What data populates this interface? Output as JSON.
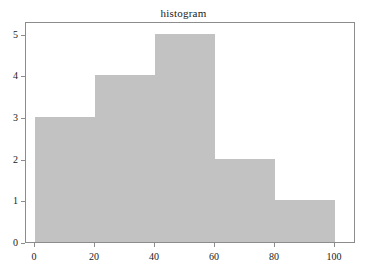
{
  "chart_data": {
    "type": "bar",
    "title": "histogram",
    "xlabel": "",
    "ylabel": "",
    "categories": [
      "0-20",
      "20-40",
      "40-60",
      "60-80",
      "80-100"
    ],
    "bin_edges": [
      0,
      20,
      40,
      60,
      80,
      100
    ],
    "values": [
      3,
      4,
      5,
      2,
      1
    ],
    "xlim": [
      -3,
      107
    ],
    "ylim": [
      0,
      5.3
    ],
    "xticks": [
      0,
      20,
      40,
      60,
      80,
      100
    ],
    "yticks": [
      0,
      1,
      2,
      3,
      4,
      5
    ],
    "xtick_labels": [
      "0",
      "20",
      "40",
      "60",
      "80",
      "100"
    ],
    "ytick_labels": [
      "0",
      "1",
      "2",
      "3",
      "4",
      "5"
    ],
    "grid": false,
    "legend": null,
    "bar_color": "#c2c2c2",
    "frame_color": "#8c8c8c",
    "background_color": "#ffffff",
    "text_color": "#1a1a1a"
  }
}
